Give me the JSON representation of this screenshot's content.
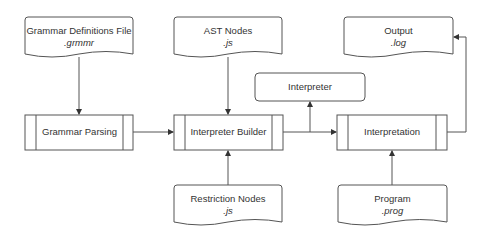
{
  "diagram": {
    "type": "flowchart",
    "colors": {
      "stroke": "#555555",
      "text": "#333333",
      "background": "#ffffff"
    },
    "nodes": [
      {
        "id": "grammar_def_file",
        "shape": "document",
        "label": "Grammar Definitions File",
        "ext": ".grmmr"
      },
      {
        "id": "ast_nodes",
        "shape": "document",
        "label": "AST Nodes",
        "ext": ".js"
      },
      {
        "id": "output",
        "shape": "document",
        "label": "Output",
        "ext": ".log"
      },
      {
        "id": "interpreter",
        "shape": "rounded-rect",
        "label": "Interpreter"
      },
      {
        "id": "grammar_parsing",
        "shape": "predefined-process",
        "label": "Grammar Parsing"
      },
      {
        "id": "interpreter_builder",
        "shape": "predefined-process",
        "label": "Interpreter Builder"
      },
      {
        "id": "interpretation",
        "shape": "predefined-process",
        "label": "Interpretation"
      },
      {
        "id": "restriction_nodes",
        "shape": "document",
        "label": "Restriction Nodes",
        "ext": ".js"
      },
      {
        "id": "program",
        "shape": "document",
        "label": "Program",
        "ext": ".prog"
      }
    ],
    "edges": [
      {
        "from": "grammar_def_file",
        "to": "grammar_parsing"
      },
      {
        "from": "ast_nodes",
        "to": "interpreter_builder"
      },
      {
        "from": "grammar_parsing",
        "to": "interpreter_builder"
      },
      {
        "from": "restriction_nodes",
        "to": "interpreter_builder"
      },
      {
        "from": "interpreter_builder",
        "to": "interpreter"
      },
      {
        "from": "interpreter_builder",
        "to": "interpretation"
      },
      {
        "from": "program",
        "to": "interpretation"
      },
      {
        "from": "interpretation",
        "to": "output"
      }
    ]
  }
}
